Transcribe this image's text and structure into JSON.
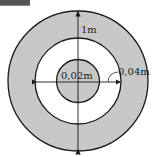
{
  "figure": {
    "labels": {
      "outer_dimension": "1m",
      "inner_diameter": "0,02m",
      "ring_width": "0,04m"
    },
    "colors": {
      "shaded": "#c8c8c8",
      "stroke": "#1a1a1a",
      "background": "#ffffff"
    }
  }
}
